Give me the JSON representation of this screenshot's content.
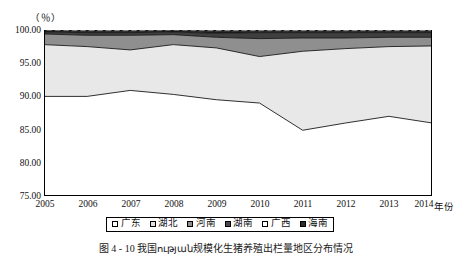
{
  "figure": {
    "unit_label": "（％）",
    "xaxis_title": "年份",
    "caption": "图 4 - 10  我国ության规模化生猪养殖出栏量地区分布情况"
  },
  "axes": {
    "y_ticks": [
      "100.00",
      "95.00",
      "90.00",
      "85.00",
      "80.00",
      "75.00"
    ],
    "x_ticks": [
      "2005",
      "2006",
      "2007",
      "2008",
      "2009",
      "2010",
      "2011",
      "2012",
      "2013",
      "2014"
    ]
  },
  "legend": {
    "items": [
      {
        "label": "广东",
        "color": "#ffffff"
      },
      {
        "label": "湖北",
        "color": "#e2e2e2"
      },
      {
        "label": "河南",
        "color": "#8f8f8f"
      },
      {
        "label": "湖南",
        "color": "#4a4a4a"
      },
      {
        "label": "广西",
        "color": "#ffffff"
      },
      {
        "label": "海南",
        "color": "#2b2b2b"
      }
    ]
  },
  "chart_data": {
    "type": "area",
    "title": "",
    "xlabel": "年份",
    "ylabel": "（％）",
    "ylim": [
      75.0,
      100.0
    ],
    "ytick_step": 5.0,
    "grid": false,
    "stacked": true,
    "legend_position": "bottom",
    "x": [
      "2005",
      "2006",
      "2007",
      "2008",
      "2009",
      "2010",
      "2011",
      "2012",
      "2013",
      "2014"
    ],
    "series": [
      {
        "name": "广东",
        "fill": "#ffffff",
        "hatch": "none",
        "values": [
          90.0,
          90.0,
          90.9,
          90.3,
          89.5,
          89.0,
          84.9,
          86.0,
          87.0,
          86.0
        ]
      },
      {
        "name": "湖北",
        "fill": "#e8e8e8",
        "hatch": "none",
        "values": [
          7.8,
          7.5,
          6.1,
          7.5,
          7.8,
          7.0,
          11.9,
          11.2,
          10.5,
          11.6
        ]
      },
      {
        "name": "河南",
        "fill": "#8f8f8f",
        "hatch": "none",
        "values": [
          1.6,
          1.7,
          2.2,
          1.5,
          1.6,
          2.7,
          2.0,
          1.6,
          1.4,
          1.3
        ]
      },
      {
        "name": "湖南",
        "fill": "#3f3f3f",
        "hatch": "none",
        "values": [
          0.3,
          0.4,
          0.4,
          0.4,
          0.6,
          0.9,
          0.8,
          0.8,
          0.7,
          0.7
        ]
      },
      {
        "name": "广西",
        "fill": "#1c1c1c",
        "hatch": "none",
        "values": [
          0.15,
          0.2,
          0.2,
          0.15,
          0.3,
          0.2,
          0.2,
          0.2,
          0.2,
          0.2
        ]
      },
      {
        "name": "海南",
        "fill": "#ffffff",
        "hatch": "diagonal",
        "values": [
          0.15,
          0.2,
          0.2,
          0.15,
          0.2,
          0.2,
          0.2,
          0.2,
          0.2,
          0.2
        ]
      }
    ],
    "cumulative_boundaries": {
      "广东_top": [
        90.0,
        90.0,
        90.9,
        90.3,
        89.5,
        89.0,
        84.9,
        86.0,
        87.0,
        86.0
      ],
      "湖北_top": [
        97.8,
        97.5,
        97.0,
        97.8,
        97.3,
        96.0,
        96.8,
        97.2,
        97.5,
        97.6
      ],
      "河南_top": [
        99.4,
        99.2,
        99.2,
        99.3,
        98.9,
        98.7,
        98.8,
        98.8,
        98.9,
        98.9
      ],
      "湖南_top": [
        99.7,
        99.6,
        99.6,
        99.7,
        99.5,
        99.6,
        99.6,
        99.6,
        99.6,
        99.6
      ],
      "广西_top": [
        99.85,
        99.8,
        99.8,
        99.85,
        99.8,
        99.8,
        99.8,
        99.8,
        99.8,
        99.8
      ],
      "海南_top": [
        100.0,
        100.0,
        100.0,
        100.0,
        100.0,
        100.0,
        100.0,
        100.0,
        100.0,
        100.0
      ]
    }
  }
}
